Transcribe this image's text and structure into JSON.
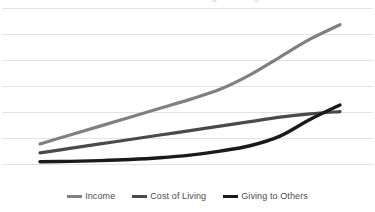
{
  "chart_data": {
    "type": "line",
    "title": "Income vs. Cost of Living vs. Giving",
    "xlabel": "",
    "ylabel": "",
    "grid": true,
    "gridlines": 7,
    "legend_position": "bottom",
    "x": [
      0,
      1,
      2,
      3,
      4,
      5,
      6,
      7,
      8,
      9,
      10
    ],
    "xlim": [
      0,
      10
    ],
    "ylim": [
      0,
      7
    ],
    "series": [
      {
        "name": "Income",
        "color": "#808080",
        "values": [
          0.9,
          1.3,
          1.7,
          2.1,
          2.5,
          2.9,
          3.35,
          4.0,
          4.8,
          5.6,
          6.25
        ]
      },
      {
        "name": "Cost of Living",
        "color": "#4a4a4a",
        "values": [
          0.5,
          0.7,
          0.9,
          1.1,
          1.3,
          1.5,
          1.7,
          1.9,
          2.1,
          2.25,
          2.35
        ]
      },
      {
        "name": "Giving to Others",
        "color": "#1a1a1a",
        "values": [
          0.1,
          0.12,
          0.15,
          0.2,
          0.28,
          0.4,
          0.58,
          0.82,
          1.25,
          2.0,
          2.65
        ]
      }
    ]
  },
  "legend": {
    "items": [
      {
        "label": "Income",
        "color": "#808080"
      },
      {
        "label": "Cost of Living",
        "color": "#4a4a4a"
      },
      {
        "label": "Giving to Others",
        "color": "#1a1a1a"
      }
    ]
  },
  "axis": {
    "gridline_color": "#e3e3e3"
  }
}
